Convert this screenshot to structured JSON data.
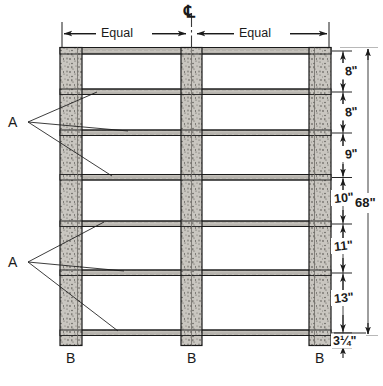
{
  "drawing": {
    "title": "Frame elevation with equal bay spacing and vertical dimension chain",
    "centerline_symbol": "℄",
    "units": "inches"
  },
  "top_dimensions": {
    "left_label": "Equal",
    "right_label": "Equal"
  },
  "vertical_dimensions": [
    {
      "label": "8\"",
      "value": 8,
      "index": 0
    },
    {
      "label": "8\"",
      "value": 8,
      "index": 1
    },
    {
      "label": "9\"",
      "value": 9,
      "index": 2
    },
    {
      "label": "10\"",
      "value": 10,
      "index": 3
    },
    {
      "label": "11\"",
      "value": 11,
      "index": 4
    },
    {
      "label": "13\"",
      "value": 13,
      "index": 5
    },
    {
      "label": "3¼\"",
      "value": 3.25,
      "index": 6
    }
  ],
  "overall_dimension": {
    "label": "68\"",
    "value": 68
  },
  "callouts": {
    "a_upper": "A",
    "a_lower": "A",
    "b_left": "B",
    "b_center": "B",
    "b_right": "B"
  },
  "colors": {
    "line": "#1a1a1a",
    "post_fill": "#c9c6c0",
    "rail_fill": "#b8b5af",
    "rail_fill_light": "#d6d3cd",
    "stipple": "#5a5852",
    "background": "#ffffff"
  }
}
